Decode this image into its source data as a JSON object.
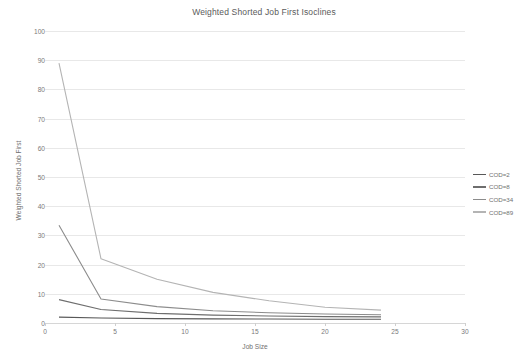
{
  "chart_data": {
    "type": "line",
    "title": "Weighted Shorted Job First Isoclines",
    "xlabel": "Job Size",
    "ylabel": "Weighted Shorted Job First",
    "xlim": [
      0,
      30
    ],
    "ylim": [
      0,
      100
    ],
    "xticks": [
      0,
      5,
      10,
      15,
      20,
      25,
      30
    ],
    "yticks": [
      0,
      10,
      20,
      30,
      40,
      50,
      60,
      70,
      80,
      90,
      100
    ],
    "grid": true,
    "legend_position": "right",
    "x": [
      1,
      4,
      8,
      12,
      16,
      20,
      24
    ],
    "series": [
      {
        "name": "COD=2",
        "color": "#585858",
        "values": [
          2.0,
          1.7,
          1.5,
          1.4,
          1.35,
          1.3,
          1.3
        ]
      },
      {
        "name": "COD=8",
        "color": "#6e6e6e",
        "values": [
          8.0,
          4.6,
          3.3,
          2.7,
          2.4,
          2.2,
          2.1
        ]
      },
      {
        "name": "COD=34",
        "color": "#8c8c8c",
        "values": [
          33.5,
          8.2,
          5.6,
          4.2,
          3.5,
          3.1,
          2.8
        ]
      },
      {
        "name": "COD=89",
        "color": "#b4b4b4",
        "values": [
          89.0,
          22.0,
          15.0,
          10.5,
          7.6,
          5.4,
          4.4
        ]
      }
    ]
  },
  "legend": {
    "items": [
      {
        "label": "COD=2"
      },
      {
        "label": "COD=8"
      },
      {
        "label": "COD=34"
      },
      {
        "label": "COD=89"
      }
    ]
  }
}
